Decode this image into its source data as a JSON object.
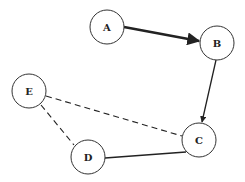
{
  "diagram": {
    "type": "graph",
    "nodes": [
      {
        "id": "A",
        "label": "A",
        "cx": 107,
        "cy": 27,
        "r": 17
      },
      {
        "id": "B",
        "label": "B",
        "cx": 217,
        "cy": 43,
        "r": 17
      },
      {
        "id": "C",
        "label": "C",
        "cx": 199,
        "cy": 140,
        "r": 17
      },
      {
        "id": "D",
        "label": "D",
        "cx": 88,
        "cy": 157,
        "r": 17
      },
      {
        "id": "E",
        "label": "E",
        "cx": 29,
        "cy": 91,
        "r": 17
      }
    ],
    "edges": [
      {
        "from": "A",
        "to": "B",
        "style": "solid-thick",
        "directed": true
      },
      {
        "from": "B",
        "to": "C",
        "style": "solid",
        "directed": true
      },
      {
        "from": "D",
        "to": "C",
        "style": "solid",
        "directed": false
      },
      {
        "from": "E",
        "to": "C",
        "style": "dashed",
        "directed": false
      },
      {
        "from": "E",
        "to": "D",
        "style": "dashed",
        "directed": false
      }
    ],
    "colors": {
      "stroke": "#222222",
      "fill": "#ffffff"
    }
  }
}
